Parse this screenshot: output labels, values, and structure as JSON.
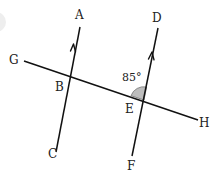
{
  "diagram": {
    "points": {
      "A": "A",
      "B": "B",
      "C": "C",
      "D": "D",
      "E": "E",
      "F": "F",
      "G": "G",
      "H": "H"
    },
    "angle_label": "85°",
    "angle_fill_color": "#bdbdbd",
    "line_color": "#111111",
    "lines": [
      {
        "name": "AC",
        "from": "C",
        "to": "A",
        "parallel_marker": "single-arrow"
      },
      {
        "name": "DF",
        "from": "F",
        "to": "D",
        "parallel_marker": "single-arrow"
      },
      {
        "name": "GH",
        "from": "G",
        "to": "H",
        "role": "transversal"
      }
    ],
    "marked_angle": {
      "vertex": "E",
      "between": [
        "ED",
        "EG"
      ],
      "value": "85°"
    }
  }
}
